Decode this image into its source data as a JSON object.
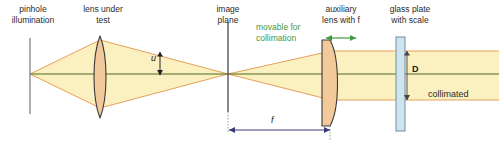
{
  "figure": {
    "width": 499,
    "height": 148,
    "background_color": "#ffffff"
  },
  "colors": {
    "beam_fill": "#faf0c0",
    "beam_edge_orange": "#e8a05a",
    "axis_green": "#4f6b22",
    "lens_glass": "#f2c99a",
    "lens_outline": "#3a3a3a",
    "plate_glass": "#cfe4ee",
    "plate_outline": "#6f8f9f",
    "reference_line_gray": "#8a8a8a",
    "dimension_blue": "#3b3b7a",
    "dimension_dark": "#222222",
    "annotation_green": "#3f9a3f",
    "label_text": "#2b2b2b"
  },
  "labels": {
    "pinhole": {
      "line1": "pinhole",
      "line2": "illumination",
      "x": 32,
      "y": 4
    },
    "lens_under_test": {
      "line1": "lens under",
      "line2": "test",
      "x": 103,
      "y": 4
    },
    "image_plane": {
      "line1": "image",
      "line2": "plane",
      "x": 228,
      "y": 4
    },
    "movable": {
      "line1": "movable for",
      "line2": "collimation",
      "x": 259,
      "y": 22
    },
    "auxiliary_lens": {
      "line1": "auxiliary",
      "line2": "lens with f",
      "x": 341,
      "y": 4
    },
    "glass_plate": {
      "line1": "glass plate",
      "line2": "with scale",
      "x": 410,
      "y": 4
    },
    "collimated": {
      "text": "collimated",
      "x": 428,
      "y": 90
    }
  },
  "dimensions": {
    "u": {
      "label": "u",
      "x": 153,
      "y": 54,
      "description": "ray height at lens under test"
    },
    "f": {
      "label": "f",
      "x": 271,
      "y": 118,
      "description": "focal length from image plane to auxiliary lens"
    },
    "D": {
      "label": "D",
      "x": 418,
      "y": 66,
      "description": "collimated beam diameter at glass plate"
    }
  },
  "components": {
    "pinhole_plane": {
      "type": "aperture-line",
      "x": 30,
      "y_top": 38,
      "y_bottom": 114
    },
    "lens_under_test": {
      "type": "biconvex-lens",
      "x": 100,
      "y_top": 36,
      "y_bottom": 118
    },
    "image_plane": {
      "type": "plane-line",
      "x": 228,
      "y_top": 22,
      "y_bottom": 112
    },
    "auxiliary_lens": {
      "type": "plano-convex-lens",
      "x": 331,
      "y_top": 40,
      "y_bottom": 126
    },
    "glass_plate": {
      "type": "glass-plate",
      "x": 398,
      "y_top": 37,
      "y_bottom": 131
    },
    "optical_axis": {
      "y": 74,
      "x_start": 30,
      "x_end": 499
    }
  },
  "arrows": {
    "movable_arrow": {
      "x_start": 325,
      "x_end": 357,
      "y": 38,
      "style": "double-headed",
      "color": "#3f9a3f"
    },
    "f_arrow": {
      "x_start": 229,
      "x_end": 330,
      "y": 128,
      "style": "double-headed",
      "color": "#3b3b7a"
    },
    "u_arrow": {
      "x": 160,
      "y_start": 52,
      "y_end": 74,
      "style": "double-headed",
      "color": "#222222"
    },
    "D_arrow": {
      "x": 407,
      "y_start": 50,
      "y_end": 98,
      "style": "double-headed",
      "color": "#555555"
    }
  }
}
